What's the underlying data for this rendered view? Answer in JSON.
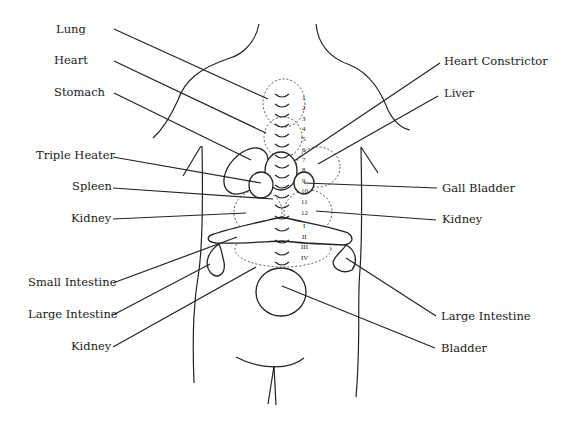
{
  "diagram": {
    "type": "anatomical back-shu point chart",
    "labels_left": [
      {
        "id": "lung",
        "text": "Lung",
        "x": 56,
        "y": 22
      },
      {
        "id": "heart",
        "text": "Heart",
        "x": 54,
        "y": 53
      },
      {
        "id": "stomach",
        "text": "Stomach",
        "x": 54,
        "y": 85
      },
      {
        "id": "triple-heater",
        "text": "Triple Heater",
        "x": 36,
        "y": 148
      },
      {
        "id": "spleen",
        "text": "Spleen",
        "x": 72,
        "y": 179
      },
      {
        "id": "kidney-upper-left",
        "text": "Kidney",
        "x": 71,
        "y": 211
      },
      {
        "id": "small-intestine",
        "text": "Small Intestine",
        "x": 28,
        "y": 275
      },
      {
        "id": "large-intestine-left",
        "text": "Large Intestine",
        "x": 28,
        "y": 307
      },
      {
        "id": "kidney-lower-left",
        "text": "Kidney",
        "x": 71,
        "y": 339
      }
    ],
    "labels_right": [
      {
        "id": "heart-constrictor",
        "text": "Heart Constrictor",
        "x": 444,
        "y": 54
      },
      {
        "id": "liver",
        "text": "Liver",
        "x": 444,
        "y": 86
      },
      {
        "id": "gall-bladder",
        "text": "Gall Bladder",
        "x": 442,
        "y": 181
      },
      {
        "id": "kidney-right",
        "text": "Kidney",
        "x": 442,
        "y": 212
      },
      {
        "id": "large-intestine-right",
        "text": "Large Intestine",
        "x": 441,
        "y": 309
      },
      {
        "id": "bladder",
        "text": "Bladder",
        "x": 441,
        "y": 341
      }
    ],
    "vertebra_numbers": [
      "1",
      "2",
      "3",
      "4",
      "5",
      "6",
      "7",
      "8",
      "9",
      "10",
      "11",
      "12",
      "I",
      "II",
      "III",
      "IV"
    ]
  }
}
